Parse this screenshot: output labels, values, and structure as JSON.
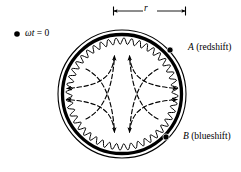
{
  "figure": {
    "background_color": "#ffffff",
    "ink_color": "#000000",
    "width": 241,
    "height": 172
  },
  "labels": {
    "phase_marker_symbol": "•",
    "phase_variable": "ωt",
    "phase_equals_value": " = 0",
    "radius_symbol": "r",
    "point_a_name": "A",
    "point_a_description": " (redshift)",
    "point_b_name": "B",
    "point_b_description": " (blueshift)"
  },
  "geometry": {
    "center_x": 122,
    "center_y": 94,
    "outer_ring_radius": 64,
    "thick_ring_radius": 60,
    "wavy_ring_radius": 53,
    "wavy_amplitude": 3.2,
    "wavy_cycles": 44,
    "outer_ring_stroke": 1.1,
    "thick_ring_stroke": 3.2,
    "wavy_ring_stroke": 1.0
  },
  "dimension_line": {
    "label": "r",
    "y": 11,
    "x_start": 113,
    "x_end": 186,
    "tick_height": 9
  },
  "markers": [
    {
      "name": "A",
      "x": 170,
      "y": 50,
      "radius": 3.1
    },
    {
      "name": "B",
      "x": 166,
      "y": 137,
      "radius": 3.1
    }
  ],
  "chart_data": {
    "type": "diagram",
    "arrow_count": 8,
    "arrow_directions": [
      "up",
      "up",
      "down",
      "down",
      "left",
      "left",
      "right",
      "right"
    ],
    "pattern": "astroid / four-pointed star",
    "annotations": [
      "ωt = 0",
      "r",
      "A (redshift)",
      "B (blueshift)"
    ]
  }
}
